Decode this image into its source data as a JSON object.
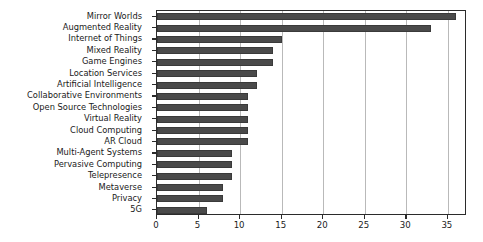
{
  "chart_data": {
    "type": "bar",
    "orientation": "horizontal",
    "title": "",
    "xlabel": "",
    "ylabel": "",
    "xlim": [
      0,
      37.3
    ],
    "xticks": [
      0,
      5,
      10,
      15,
      20,
      25,
      30,
      35
    ],
    "grid": true,
    "grid_axis": "x",
    "legend": false,
    "bar_color": "#4a4a4a",
    "categories": [
      "Mirror Worlds",
      "Augmented Reality",
      "Internet of Things",
      "Mixed Reality",
      "Game Engines",
      "Location Services",
      "Artificial Intelligence",
      "Collaborative Environments",
      "Open Source Technologies",
      "Virtual Reality",
      "Cloud Computing",
      "AR Cloud",
      "Multi-Agent Systems",
      "Pervasive Computing",
      "Telepresence",
      "Metaverse",
      "Privacy",
      "5G"
    ],
    "values": [
      36,
      33,
      15,
      14,
      14,
      12,
      12,
      11,
      11,
      11,
      11,
      11,
      9,
      9,
      9,
      8,
      8,
      6
    ]
  }
}
